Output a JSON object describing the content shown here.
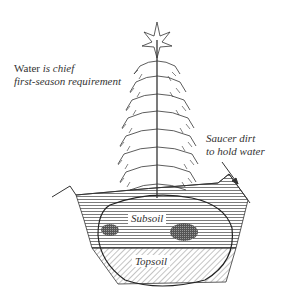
{
  "diagram": {
    "annotations": {
      "water": {
        "line1_plain": "Water ",
        "line1_italic": "is chief",
        "line2": "first-season requirement"
      },
      "saucer": {
        "line1": "Saucer dirt",
        "line2": "to hold water"
      }
    },
    "layers": {
      "subsoil": "Subsoil",
      "topsoil": "Topsoil"
    },
    "colors": {
      "ink": "#333333",
      "background": "#ffffff"
    }
  }
}
